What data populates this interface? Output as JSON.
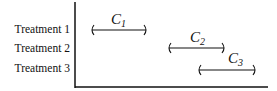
{
  "diagram": {
    "type": "interval comparison",
    "rows": [
      {
        "label": "Treatment 1",
        "interval": "C",
        "subscript": "1",
        "x_start": 91,
        "x_end": 147,
        "y": 30
      },
      {
        "label": "Treatment 2",
        "interval": "C",
        "subscript": "2",
        "x_start": 168,
        "x_end": 225,
        "y": 48
      },
      {
        "label": "Treatment 3",
        "interval": "C",
        "subscript": "3",
        "x_start": 198,
        "x_end": 256,
        "y": 70
      }
    ],
    "colors": {
      "line": "#111111",
      "background": "#ffffff"
    }
  }
}
